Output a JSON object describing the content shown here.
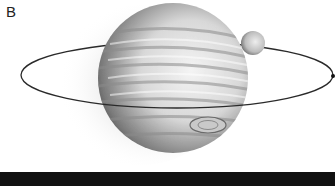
{
  "figure": {
    "panel_label": "B",
    "colors": {
      "background": "#ffffff",
      "orbit_line": "#2a2a2a",
      "bottom_bar": "#111111",
      "planet_light": "#f2f2f2",
      "planet_dark": "#3a3a3a",
      "band": "#8a8a8a"
    }
  }
}
